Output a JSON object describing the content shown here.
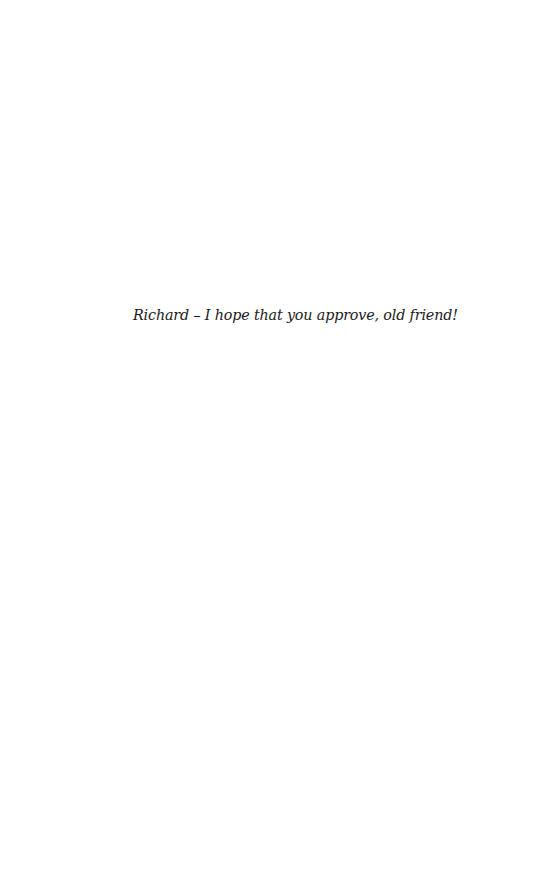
{
  "page": {
    "dedication": "Richard – I hope that you approve, old friend!"
  }
}
